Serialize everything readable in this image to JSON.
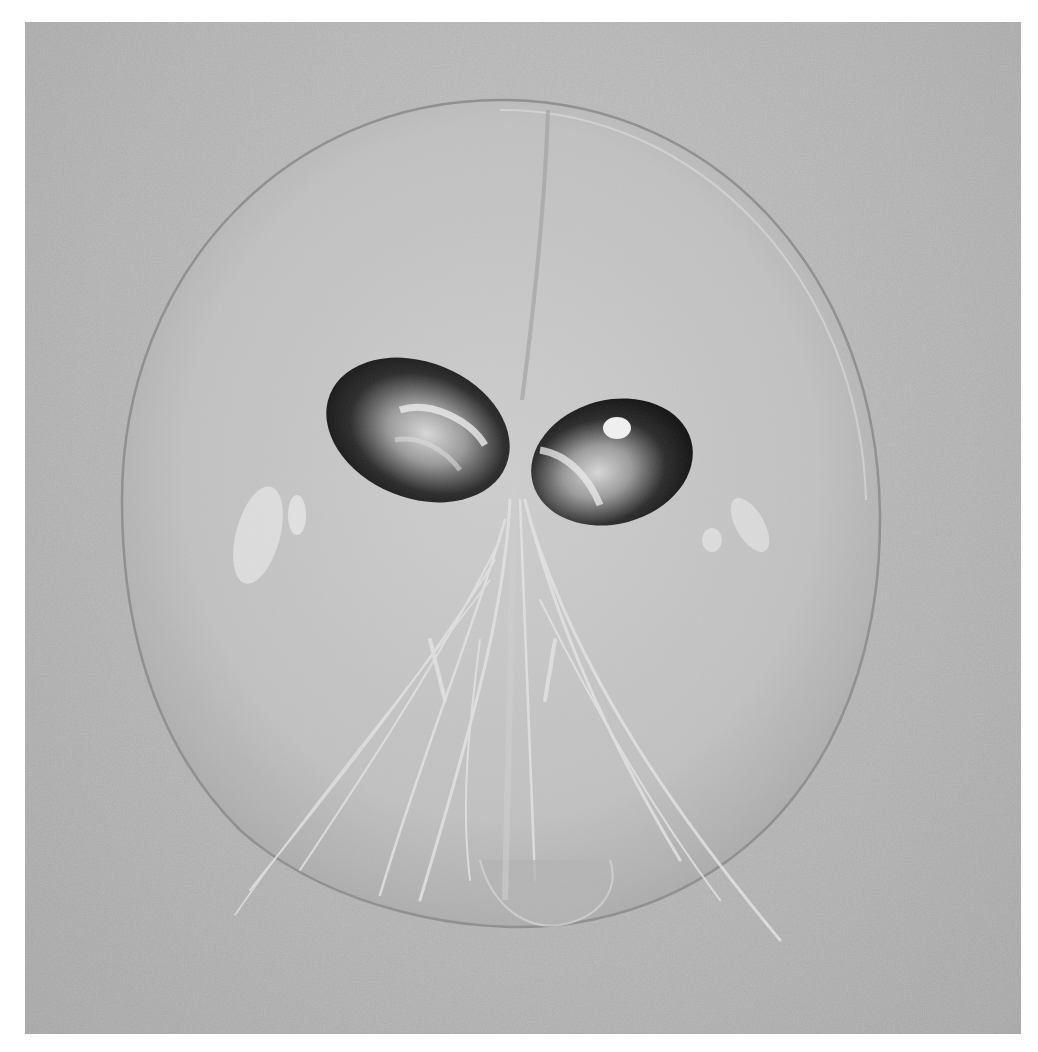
{
  "image": {
    "description": "Grayscale photograph of a transparent, nearly circular larval crustacean with two dark eyes at the centre and fan-like appendages trailing downward",
    "palette": {
      "border": "#ffffff",
      "background": "#b8b8b8",
      "carapace_fill": "#c8c8c8",
      "carapace_edge": "#8e8e8e",
      "eye_dark": "#1a1a1a",
      "eye_highlight": "#e8e8e8",
      "appendage_light": "#e2e2e2"
    },
    "subject": {
      "carapace": {
        "cx": 500,
        "cy": 535,
        "rx": 378,
        "ry": 430
      },
      "eyes": [
        {
          "side": "left",
          "cx": 418,
          "cy": 430
        },
        {
          "side": "right",
          "cx": 612,
          "cy": 462
        }
      ]
    }
  }
}
